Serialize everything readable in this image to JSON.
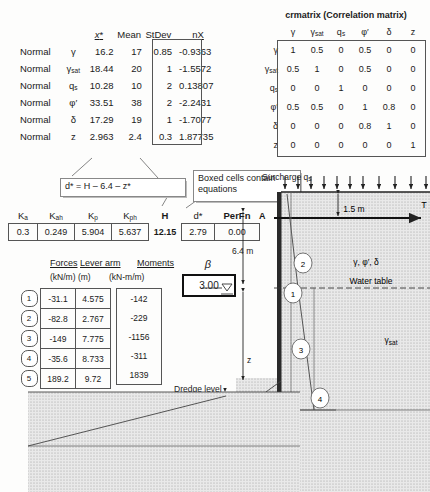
{
  "variables_table": {
    "headers": [
      "",
      "",
      "x*",
      "Mean",
      "StDev",
      "nX"
    ],
    "rows": [
      {
        "dist": "Normal",
        "sym": "γ",
        "sym_sub": "",
        "x": "16.2",
        "mean": "17",
        "sd": "0.85",
        "nx": "-0.9363"
      },
      {
        "dist": "Normal",
        "sym": "γ",
        "sym_sub": "sat",
        "x": "18.44",
        "mean": "20",
        "sd": "1",
        "nx": "-1.5572"
      },
      {
        "dist": "Normal",
        "sym": "q",
        "sym_sub": "s",
        "x": "10.28",
        "mean": "10",
        "sd": "2",
        "nx": "0.13807"
      },
      {
        "dist": "Normal",
        "sym": "φ′",
        "sym_sub": "",
        "x": "33.51",
        "mean": "38",
        "sd": "2",
        "nx": "-2.2431"
      },
      {
        "dist": "Normal",
        "sym": "δ",
        "sym_sub": "",
        "x": "17.29",
        "mean": "19",
        "sd": "1",
        "nx": "-1.7077"
      },
      {
        "dist": "Normal",
        "sym": "z",
        "sym_sub": "",
        "x": "2.963",
        "mean": "2.4",
        "sd": "0.3",
        "nx": "1.87735"
      }
    ]
  },
  "correlation_matrix": {
    "title": "crmatrix (Correlation matrix)",
    "col_labels": [
      {
        "sym": "γ",
        "sub": ""
      },
      {
        "sym": "γ",
        "sub": "sat"
      },
      {
        "sym": "q",
        "sub": "s"
      },
      {
        "sym": "φ′",
        "sub": ""
      },
      {
        "sym": "δ",
        "sub": ""
      },
      {
        "sym": "z",
        "sub": ""
      }
    ],
    "row_labels": [
      {
        "sym": "γ",
        "sub": ""
      },
      {
        "sym": "γ",
        "sub": "sat"
      },
      {
        "sym": "q",
        "sub": "s"
      },
      {
        "sym": "φ′",
        "sub": ""
      },
      {
        "sym": "δ",
        "sub": ""
      },
      {
        "sym": "z",
        "sub": ""
      }
    ],
    "values": [
      [
        "1",
        "0.5",
        "0",
        "0.5",
        "0",
        "0"
      ],
      [
        "0.5",
        "1",
        "0",
        "0.5",
        "0",
        "0"
      ],
      [
        "0",
        "0",
        "1",
        "0",
        "0",
        "0"
      ],
      [
        "0.5",
        "0.5",
        "0",
        "1",
        "0.8",
        "0"
      ],
      [
        "0",
        "0",
        "0",
        "0.8",
        "1",
        "0"
      ],
      [
        "0",
        "0",
        "0",
        "0",
        "0",
        "1"
      ]
    ]
  },
  "callouts": {
    "equation": "d* = H – 6.4 – z*",
    "boxed_cells": "Boxed cells contain equations"
  },
  "k_row": {
    "headers": [
      {
        "sym": "K",
        "sub": "a"
      },
      {
        "sym": "K",
        "sub": "ah"
      },
      {
        "sym": "K",
        "sub": "p"
      },
      {
        "sym": "K",
        "sub": "ph"
      },
      {
        "sym": "H",
        "sub": ""
      },
      {
        "sym": "d*",
        "sub": ""
      },
      {
        "sym": "PerFn",
        "sub": ""
      }
    ],
    "values": [
      "0.3",
      "0.249",
      "5.904",
      "5.637",
      "12.15",
      "2.79",
      "0.00"
    ]
  },
  "forces": {
    "header_forces": "Forces",
    "header_lever": "Lever arm",
    "header_moments": "Moments",
    "units_force": "(kN/m)",
    "units_lever": "(m)",
    "units_moments": "(kN-m/m)",
    "rows": [
      {
        "id": "1",
        "force": "-31.1",
        "lever": "4.575",
        "moment": "-142"
      },
      {
        "id": "2",
        "force": "-82.8",
        "lever": "2.767",
        "moment": "-229"
      },
      {
        "id": "3",
        "force": "-149",
        "lever": "7.775",
        "moment": "-1156"
      },
      {
        "id": "4",
        "force": "-35.6",
        "lever": "8.733",
        "moment": "-311"
      },
      {
        "id": "5",
        "force": "189.2",
        "lever": "9.72",
        "moment": "1839"
      }
    ]
  },
  "beta": {
    "label": "β",
    "value": "3.00"
  },
  "diagram": {
    "surcharge_label": "Surcharge q",
    "surcharge_sub": "s",
    "depth_1_5": "1.5 m",
    "depth_6_4": "6.4 m",
    "point_a": "A",
    "tension_label": "T",
    "soil_params": "γ, φ′, δ",
    "water_table": "Water table",
    "gamma_sat": "γ",
    "gamma_sat_sub": "sat",
    "z_label": "z",
    "d_label": "d",
    "dredge_level": "Dredge level",
    "zone_labels": [
      "1",
      "2",
      "3",
      "4",
      "5"
    ]
  },
  "colors": {
    "line": "#333333",
    "soil_fill": "#d8d8d8",
    "accent": "#111111"
  }
}
